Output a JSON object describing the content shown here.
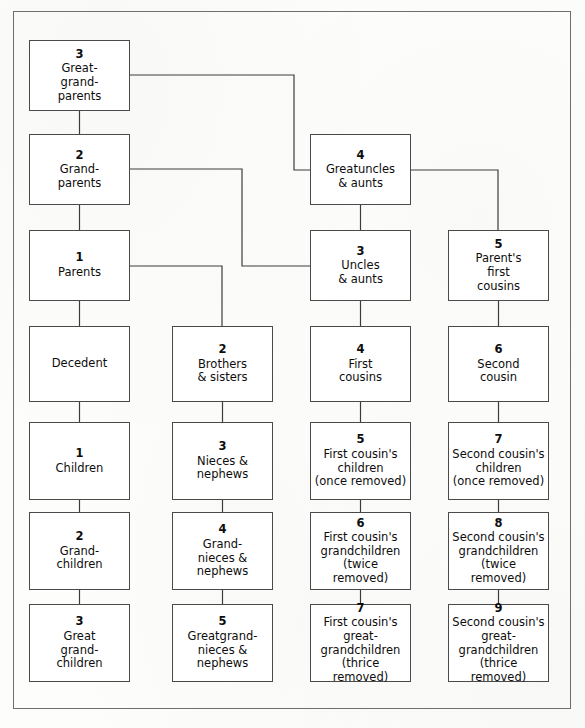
{
  "diagram": {
    "frame": {
      "stroke": "#6e6e6e"
    },
    "box_stroke": "#4a4a4a",
    "line_stroke": "#3c3c3c",
    "background": "#fdfdfc",
    "nodes": [
      {
        "id": "great-grandparents",
        "num": "3",
        "label": "Great-\ngrand-\nparents",
        "x": 29,
        "y": 40,
        "w": 101,
        "h": 71
      },
      {
        "id": "grandparents",
        "num": "2",
        "label": "Grand-\nparents",
        "x": 29,
        "y": 134,
        "w": 101,
        "h": 71
      },
      {
        "id": "parents",
        "num": "1",
        "label": "Parents",
        "x": 29,
        "y": 230,
        "w": 101,
        "h": 71
      },
      {
        "id": "decedent",
        "num": "",
        "label": "Decedent",
        "x": 29,
        "y": 326,
        "w": 101,
        "h": 76
      },
      {
        "id": "children",
        "num": "1",
        "label": "Children",
        "x": 29,
        "y": 422,
        "w": 101,
        "h": 78
      },
      {
        "id": "grandchildren",
        "num": "2",
        "label": "Grand-\nchildren",
        "x": 29,
        "y": 512,
        "w": 101,
        "h": 78
      },
      {
        "id": "great-grandchildren",
        "num": "3",
        "label": "Great\ngrand-\nchildren",
        "x": 29,
        "y": 604,
        "w": 101,
        "h": 78
      },
      {
        "id": "brothers-sisters",
        "num": "2",
        "label": "Brothers\n& sisters",
        "x": 172,
        "y": 326,
        "w": 101,
        "h": 76
      },
      {
        "id": "nieces-nephews",
        "num": "3",
        "label": "Nieces &\nnephews",
        "x": 172,
        "y": 422,
        "w": 101,
        "h": 78
      },
      {
        "id": "grandnieces-nephews",
        "num": "4",
        "label": "Grand-\nnieces &\nnephews",
        "x": 172,
        "y": 512,
        "w": 101,
        "h": 78
      },
      {
        "id": "greatgrandnieces-nephews",
        "num": "5",
        "label": "Greatgrand-\nnieces &\nnephews",
        "x": 172,
        "y": 604,
        "w": 101,
        "h": 78
      },
      {
        "id": "greatuncles-aunts",
        "num": "4",
        "label": "Greatuncles\n& aunts",
        "x": 310,
        "y": 134,
        "w": 101,
        "h": 71
      },
      {
        "id": "uncles-aunts",
        "num": "3",
        "label": "Uncles\n& aunts",
        "x": 310,
        "y": 230,
        "w": 101,
        "h": 71
      },
      {
        "id": "first-cousins",
        "num": "4",
        "label": "First\ncousins",
        "x": 310,
        "y": 326,
        "w": 101,
        "h": 76
      },
      {
        "id": "first-cousins-children",
        "num": "5",
        "label": "First cousin's\nchildren\n(once removed)",
        "x": 310,
        "y": 422,
        "w": 101,
        "h": 78
      },
      {
        "id": "first-cousins-grandchildren",
        "num": "6",
        "label": "First cousin's\ngrandchildren\n(twice removed)",
        "x": 310,
        "y": 512,
        "w": 101,
        "h": 78
      },
      {
        "id": "first-cousins-great-grandchildren",
        "num": "7",
        "label": "First cousin's\ngreat-\ngrandchildren\n(thrice removed)",
        "x": 310,
        "y": 604,
        "w": 101,
        "h": 78
      },
      {
        "id": "parents-first-cousins",
        "num": "5",
        "label": "Parent's\nfirst\ncousins",
        "x": 448,
        "y": 230,
        "w": 101,
        "h": 71
      },
      {
        "id": "second-cousin",
        "num": "6",
        "label": "Second\ncousin",
        "x": 448,
        "y": 326,
        "w": 101,
        "h": 76
      },
      {
        "id": "second-cousins-children",
        "num": "7",
        "label": "Second cousin's\nchildren\n(once removed)",
        "x": 448,
        "y": 422,
        "w": 101,
        "h": 78
      },
      {
        "id": "second-cousins-grandchildren",
        "num": "8",
        "label": "Second cousin's\ngrandchildren\n(twice removed)",
        "x": 448,
        "y": 512,
        "w": 101,
        "h": 78
      },
      {
        "id": "second-cousins-great-grandchildren",
        "num": "9",
        "label": "Second cousin's\ngreat-\ngrandchildren\n(thrice removed)",
        "x": 448,
        "y": 604,
        "w": 101,
        "h": 78
      }
    ],
    "connectors": [
      {
        "id": "ggp-to-gp",
        "from": "great-grandparents",
        "to": "grandparents",
        "path": "M 79.5 111 L 79.5 134"
      },
      {
        "id": "gp-to-parents",
        "from": "grandparents",
        "to": "parents",
        "path": "M 79.5 205 L 79.5 230"
      },
      {
        "id": "parents-to-decedent",
        "from": "parents",
        "to": "decedent",
        "path": "M 79.5 301 L 79.5 326"
      },
      {
        "id": "decedent-to-children",
        "from": "decedent",
        "to": "children",
        "path": "M 79.5 402 L 79.5 422"
      },
      {
        "id": "children-to-grandchildren",
        "from": "children",
        "to": "grandchildren",
        "path": "M 79.5 500 L 79.5 512"
      },
      {
        "id": "grandchildren-to-greatgrandchildren",
        "from": "grandchildren",
        "to": "great-grandchildren",
        "path": "M 79.5 590 L 79.5 604"
      },
      {
        "id": "ggp-to-greatuncles",
        "from": "great-grandparents",
        "to": "greatuncles-aunts",
        "path": "M 130 75 L 294 75 L 294 170 L 310 170"
      },
      {
        "id": "gp-to-uncles",
        "from": "grandparents",
        "to": "uncles-aunts",
        "path": "M 130 169 L 242 169 L 242 266 L 310 266"
      },
      {
        "id": "parents-to-brothers",
        "from": "parents",
        "to": "brothers-sisters",
        "path": "M 130 266 L 222 266 L 222 326"
      },
      {
        "id": "greatuncles-to-parents-first-cousins",
        "from": "greatuncles-aunts",
        "to": "parents-first-cousins",
        "path": "M 411 170 L 498 170 L 498 230"
      },
      {
        "id": "greatuncles-to-uncles",
        "from": "greatuncles-aunts",
        "to": "uncles-aunts",
        "path": "M 360.5 205 L 360.5 230"
      },
      {
        "id": "uncles-to-first-cousins",
        "from": "uncles-aunts",
        "to": "first-cousins",
        "path": "M 360.5 301 L 360.5 326"
      },
      {
        "id": "first-cousins-down-1",
        "from": "first-cousins",
        "to": "first-cousins-children",
        "path": "M 360.5 402 L 360.5 422"
      },
      {
        "id": "first-cousins-down-2",
        "from": "first-cousins-children",
        "to": "first-cousins-grandchildren",
        "path": "M 360.5 500 L 360.5 512"
      },
      {
        "id": "first-cousins-down-3",
        "from": "first-cousins-grandchildren",
        "to": "first-cousins-great-grandchildren",
        "path": "M 360.5 590 L 360.5 604"
      },
      {
        "id": "parents-first-cousins-to-second-cousin",
        "from": "parents-first-cousins",
        "to": "second-cousin",
        "path": "M 498.5 301 L 498.5 326"
      },
      {
        "id": "second-cousin-down-1",
        "from": "second-cousin",
        "to": "second-cousins-children",
        "path": "M 498.5 402 L 498.5 422"
      },
      {
        "id": "second-cousin-down-2",
        "from": "second-cousins-children",
        "to": "second-cousins-grandchildren",
        "path": "M 498.5 500 L 498.5 512"
      },
      {
        "id": "second-cousin-down-3",
        "from": "second-cousins-grandchildren",
        "to": "second-cousins-great-grandchildren",
        "path": "M 498.5 590 L 498.5 604"
      },
      {
        "id": "brothers-down-1",
        "from": "brothers-sisters",
        "to": "nieces-nephews",
        "path": "M 222.5 402 L 222.5 422"
      },
      {
        "id": "brothers-down-2",
        "from": "nieces-nephews",
        "to": "grandnieces-nephews",
        "path": "M 222.5 500 L 222.5 512"
      },
      {
        "id": "brothers-down-3",
        "from": "grandnieces-nephews",
        "to": "greatgrandnieces-nephews",
        "path": "M 222.5 590 L 222.5 604"
      }
    ]
  }
}
